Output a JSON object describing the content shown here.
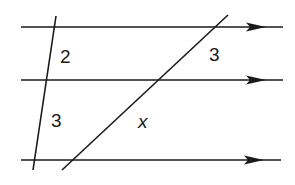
{
  "diagram": {
    "line_color": "#1a1a1a",
    "parallel_lines": [
      {
        "id": "top",
        "y": 27,
        "x1": 21,
        "x2": 283,
        "arrow": true
      },
      {
        "id": "middle",
        "y": 80,
        "x1": 21,
        "x2": 283,
        "arrow": true
      },
      {
        "id": "bottom",
        "y": 160,
        "x1": 21,
        "x2": 281,
        "arrow": true
      }
    ],
    "transversals": [
      {
        "id": "left",
        "x1": 56,
        "y1": 16,
        "x2": 33,
        "y2": 170
      },
      {
        "id": "right",
        "x1": 228,
        "y1": 15,
        "x2": 62,
        "y2": 170
      }
    ],
    "labels": {
      "left_upper": "2",
      "left_lower": "3",
      "right_upper": "3",
      "right_lower": "x"
    }
  }
}
